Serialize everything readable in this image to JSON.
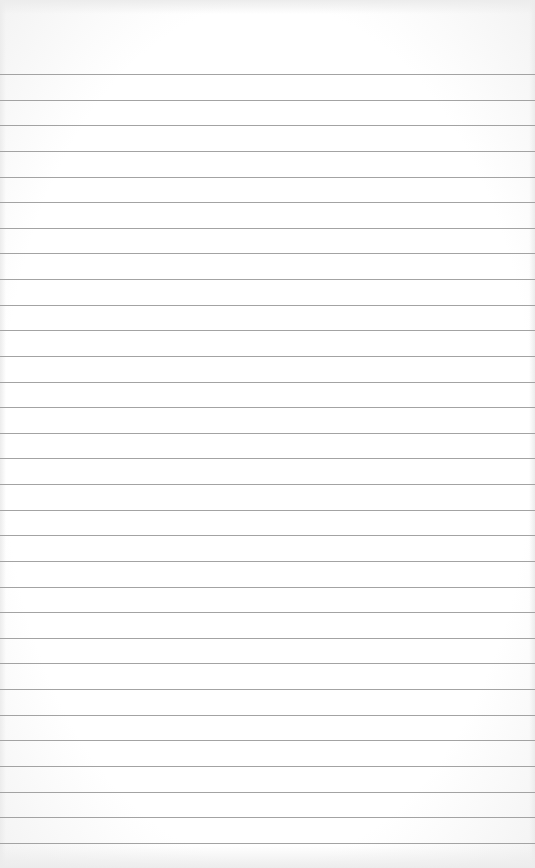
{
  "paper": {
    "type": "ruled-notepad-sheet",
    "line_color": "#a3a3a3",
    "background_color": "#ffffff",
    "rule_count": 31,
    "first_rule_y": 74,
    "rule_spacing": 25.63
  }
}
